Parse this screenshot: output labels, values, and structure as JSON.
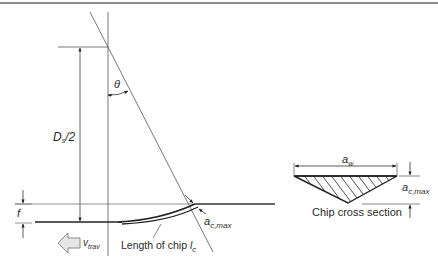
{
  "diagram": {
    "type": "grinding chip formation geometry",
    "labels": {
      "theta": "θ",
      "wheel_radius_main": "D",
      "wheel_radius_sub": "s",
      "wheel_radius_tail": "/2",
      "feed": "f",
      "max_chip_thickness_main": "a",
      "max_chip_thickness_sub": "c,max",
      "traverse_speed_main": "v",
      "traverse_speed_sub": "trav",
      "chip_length_text": "Length of chip ",
      "chip_length_symbol": "l",
      "chip_length_sub": "c",
      "cross_section_width_main": "a",
      "cross_section_width_sub": "w",
      "cross_section_height_main": "a",
      "cross_section_height_sub": "c,max",
      "cross_section_caption": "Chip cross section"
    },
    "colors": {
      "line": "#333333",
      "thin_line": "#666666",
      "header_bar": "#8a8a8a",
      "arrow_fill": "#e6e6e6",
      "arrow_stroke": "#8a8a8a",
      "text": "#2a2a2a"
    }
  }
}
